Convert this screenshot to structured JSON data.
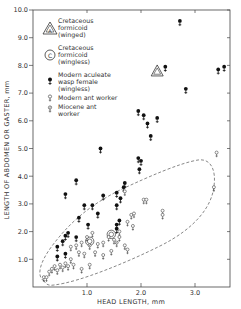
{
  "chart_data": {
    "type": "scatter",
    "title": "",
    "xlabel": "HEAD LENGTH, mm",
    "ylabel": "LENGTH OF ABDOMEN OR GASTER, mm",
    "xlim": [
      0,
      3.65
    ],
    "ylim": [
      0,
      10.0
    ],
    "x_ticks": [
      "1.0",
      "2.0",
      "3.0"
    ],
    "x_tick_values": [
      1.0,
      2.0,
      3.0
    ],
    "y_ticks": [
      "1.0",
      "2.0",
      "3.0",
      "4.0",
      "5.0",
      "6.0",
      "7.0",
      "8.0",
      "9.0",
      "10.0"
    ],
    "y_tick_values": [
      1,
      2,
      3,
      4,
      5,
      6,
      7,
      8,
      9,
      10
    ],
    "grid": false,
    "legend_position": "upper left (inside)",
    "legend": [
      {
        "marker": "triangle-a",
        "label_lines": [
          "Cretaceous",
          "formicoid",
          "(winged)"
        ]
      },
      {
        "marker": "circle-c",
        "label_lines": [
          "Cretaceous",
          "formicoid",
          "(wingless)"
        ]
      },
      {
        "marker": "filled-female",
        "label_lines": [
          "Modern aculeate",
          "wasp female",
          "(wingless)"
        ]
      },
      {
        "marker": "open-female",
        "label_lines": [
          "Modern ant worker"
        ]
      },
      {
        "marker": "open-female-slash",
        "label_lines": [
          "Miocene ant",
          "worker"
        ]
      }
    ],
    "annotation": "dashed envelope enclosing ant worker points",
    "series": [
      {
        "name": "Cretaceous formicoid (winged)",
        "marker": "triangle-a",
        "points": [
          [
            2.3,
            7.8
          ]
        ]
      },
      {
        "name": "Cretaceous formicoid (wingless)",
        "marker": "circle-c",
        "points": [
          [
            1.05,
            1.65
          ],
          [
            1.45,
            1.9
          ]
        ]
      },
      {
        "name": "Modern aculeate wasp female (wingless)",
        "marker": "filled-female",
        "points": [
          [
            2.72,
            9.55
          ],
          [
            2.45,
            7.9
          ],
          [
            2.83,
            7.1
          ],
          [
            3.43,
            7.8
          ],
          [
            3.54,
            7.9
          ],
          [
            1.95,
            6.3
          ],
          [
            2.05,
            6.15
          ],
          [
            2.12,
            5.85
          ],
          [
            2.3,
            6.05
          ],
          [
            2.18,
            5.4
          ],
          [
            1.25,
            4.95
          ],
          [
            1.95,
            4.6
          ],
          [
            2.0,
            4.5
          ],
          [
            1.97,
            4.2
          ],
          [
            0.8,
            3.8
          ],
          [
            0.6,
            3.3
          ],
          [
            1.3,
            3.25
          ],
          [
            1.55,
            3.35
          ],
          [
            1.68,
            3.55
          ],
          [
            1.62,
            3.15
          ],
          [
            1.7,
            3.7
          ],
          [
            1.55,
            2.9
          ],
          [
            0.95,
            2.9
          ],
          [
            1.1,
            2.9
          ],
          [
            0.85,
            2.45
          ],
          [
            1.2,
            2.6
          ],
          [
            1.55,
            2.2
          ],
          [
            1.6,
            2.35
          ],
          [
            1.02,
            2.2
          ],
          [
            1.55,
            2.05
          ],
          [
            0.6,
            1.8
          ],
          [
            0.65,
            1.9
          ],
          [
            0.8,
            1.75
          ],
          [
            0.55,
            1.6
          ],
          [
            0.45,
            1.4
          ],
          [
            0.6,
            1.15
          ],
          [
            0.45,
            1.05
          ]
        ]
      },
      {
        "name": "Modern ant worker",
        "marker": "open-female",
        "points": [
          [
            3.4,
            4.8
          ],
          [
            3.35,
            3.55
          ],
          [
            2.05,
            3.1
          ],
          [
            2.1,
            3.1
          ],
          [
            1.7,
            3.4
          ],
          [
            1.82,
            2.55
          ],
          [
            1.87,
            2.6
          ],
          [
            1.75,
            2.3
          ],
          [
            1.85,
            2.15
          ],
          [
            1.6,
            1.95
          ],
          [
            1.6,
            1.75
          ],
          [
            2.4,
            2.7
          ],
          [
            2.4,
            2.55
          ],
          [
            1.5,
            1.65
          ],
          [
            1.4,
            1.75
          ],
          [
            1.3,
            1.55
          ],
          [
            1.2,
            1.5
          ],
          [
            1.1,
            1.9
          ],
          [
            1.0,
            1.75
          ],
          [
            0.9,
            1.55
          ],
          [
            0.8,
            1.45
          ],
          [
            0.7,
            1.4
          ],
          [
            0.85,
            1.2
          ],
          [
            0.95,
            1.15
          ],
          [
            1.15,
            1.2
          ],
          [
            1.3,
            1.1
          ],
          [
            1.45,
            1.25
          ],
          [
            0.7,
            0.95
          ],
          [
            0.6,
            0.8
          ],
          [
            0.5,
            0.75
          ],
          [
            0.4,
            0.7
          ],
          [
            0.35,
            0.6
          ],
          [
            0.3,
            0.5
          ],
          [
            0.45,
            0.55
          ],
          [
            0.55,
            0.65
          ],
          [
            0.65,
            0.7
          ],
          [
            0.75,
            0.75
          ],
          [
            0.9,
            0.6
          ],
          [
            1.05,
            0.75
          ],
          [
            0.2,
            0.3
          ],
          [
            0.25,
            0.3
          ],
          [
            1.7,
            1.45
          ],
          [
            1.75,
            1.3
          ]
        ]
      },
      {
        "name": "Miocene ant worker",
        "marker": "open-female-slash",
        "points": [
          [
            1.05,
            1.45
          ],
          [
            1.55,
            1.55
          ]
        ]
      }
    ]
  },
  "axis": {
    "x_title": "HEAD LENGTH, mm",
    "y_title": "LENGTH OF ABDOMEN OR GASTER, mm"
  },
  "legend": {
    "item0": {
      "l1": "Cretaceous",
      "l2": "formicoid",
      "l3": "(winged)"
    },
    "item1": {
      "l1": "Cretaceous",
      "l2": "formicoid",
      "l3": "(wingless)"
    },
    "item2": {
      "l1": "Modern aculeate",
      "l2": "wasp female",
      "l3": "(wingless)"
    },
    "item3": {
      "l1": "Modern ant worker"
    },
    "item4": {
      "l1": "Miocene ant",
      "l2": "worker"
    }
  },
  "marker_glyphs": {
    "triangle_letter": "A",
    "circle_letter": "C"
  }
}
